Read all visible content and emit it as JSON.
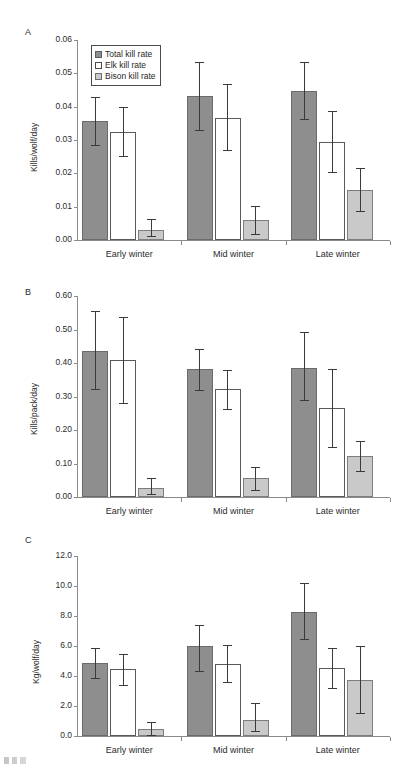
{
  "figure": {
    "legend": {
      "items": [
        {
          "label": "Total kill rate",
          "key": "total",
          "swatch_color": "#8e8e8e"
        },
        {
          "label": "Elk kill rate",
          "key": "elk",
          "swatch_color": "#ffffff"
        },
        {
          "label": "Bison kill rate",
          "key": "bison",
          "swatch_color": "#c9c9c9"
        }
      ]
    },
    "panels": [
      {
        "letter": "A",
        "ylabel": "Kills/wolf/day",
        "yticks": [
          "0.00",
          "0.01",
          "0.02",
          "0.03",
          "0.04",
          "0.05",
          "0.06"
        ],
        "xticklabels": [
          "Early winter",
          "Mid winter",
          "Late winter"
        ]
      },
      {
        "letter": "B",
        "ylabel": "Kills/pack/day",
        "yticks": [
          "0.00",
          "0.10",
          "0.20",
          "0.30",
          "0.40",
          "0.50",
          "0.60"
        ],
        "xticklabels": [
          "Early winter",
          "Mid winter",
          "Late winter"
        ]
      },
      {
        "letter": "C",
        "ylabel": "Kg/wolf/day",
        "yticks": [
          "0.0",
          "2.0",
          "4.0",
          "6.0",
          "8.0",
          "10.0",
          "12.0"
        ],
        "xticklabels": [
          "Early winter",
          "Mid winter",
          "Late winter"
        ]
      }
    ]
  },
  "chart_data": [
    {
      "type": "bar",
      "panel": "A",
      "title": "",
      "xlabel": "",
      "ylabel": "Kills/wolf/day",
      "ylim": [
        0.0,
        0.06
      ],
      "ytick_interval": 0.01,
      "grid": false,
      "legend_position": "upper-left-inside",
      "categories": [
        "Early winter",
        "Mid winter",
        "Late winter"
      ],
      "series": [
        {
          "name": "Total kill rate",
          "color": "#8e8e8e",
          "values": [
            0.0358,
            0.0433,
            0.0447
          ],
          "error_low": [
            0.0283,
            0.0326,
            0.0361
          ],
          "error_high": [
            0.0428,
            0.0535,
            0.0533
          ]
        },
        {
          "name": "Elk kill rate",
          "color": "#ffffff",
          "values": [
            0.0325,
            0.0365,
            0.0293
          ],
          "error_low": [
            0.025,
            0.0268,
            0.0201
          ],
          "error_high": [
            0.04,
            0.0467,
            0.0388
          ]
        },
        {
          "name": "Bison kill rate",
          "color": "#c9c9c9",
          "values": [
            0.0029,
            0.0061,
            0.0149
          ],
          "error_low": [
            0.0008,
            0.0014,
            0.0085
          ],
          "error_high": [
            0.0062,
            0.0101,
            0.0215
          ]
        }
      ]
    },
    {
      "type": "bar",
      "panel": "B",
      "title": "",
      "xlabel": "",
      "ylabel": "Kills/pack/day",
      "ylim": [
        0.0,
        0.6
      ],
      "ytick_interval": 0.1,
      "grid": false,
      "legend_position": "none",
      "categories": [
        "Early winter",
        "Mid winter",
        "Late winter"
      ],
      "series": [
        {
          "name": "Total kill rate",
          "color": "#8e8e8e",
          "values": [
            0.436,
            0.382,
            0.386
          ],
          "error_low": [
            0.32,
            0.316,
            0.287
          ],
          "error_high": [
            0.556,
            0.443,
            0.492
          ]
        },
        {
          "name": "Elk kill rate",
          "color": "#ffffff",
          "values": [
            0.408,
            0.321,
            0.266
          ],
          "error_low": [
            0.278,
            0.261,
            0.147
          ],
          "error_high": [
            0.537,
            0.378,
            0.383
          ]
        },
        {
          "name": "Bison kill rate",
          "color": "#c9c9c9",
          "values": [
            0.027,
            0.056,
            0.121
          ],
          "error_low": [
            0.006,
            0.018,
            0.076
          ],
          "error_high": [
            0.057,
            0.09,
            0.166
          ]
        }
      ]
    },
    {
      "type": "bar",
      "panel": "C",
      "title": "",
      "xlabel": "",
      "ylabel": "Kg/wolf/day",
      "ylim": [
        0.0,
        12.0
      ],
      "ytick_interval": 2.0,
      "grid": false,
      "legend_position": "none",
      "categories": [
        "Early winter",
        "Mid winter",
        "Late winter"
      ],
      "series": [
        {
          "name": "Total kill rate",
          "color": "#8e8e8e",
          "values": [
            4.9,
            6.0,
            8.3
          ],
          "error_low": [
            3.8,
            4.3,
            6.4
          ],
          "error_high": [
            5.9,
            7.4,
            10.2
          ]
        },
        {
          "name": "Elk kill rate",
          "color": "#ffffff",
          "values": [
            4.45,
            4.8,
            4.55
          ],
          "error_low": [
            3.35,
            3.55,
            3.15
          ],
          "error_high": [
            5.5,
            6.05,
            5.9
          ]
        },
        {
          "name": "Bison kill rate",
          "color": "#c9c9c9",
          "values": [
            0.45,
            1.1,
            3.75
          ],
          "error_low": [
            0.0,
            0.25,
            1.45
          ],
          "error_high": [
            0.95,
            2.2,
            6.0
          ]
        }
      ]
    }
  ]
}
